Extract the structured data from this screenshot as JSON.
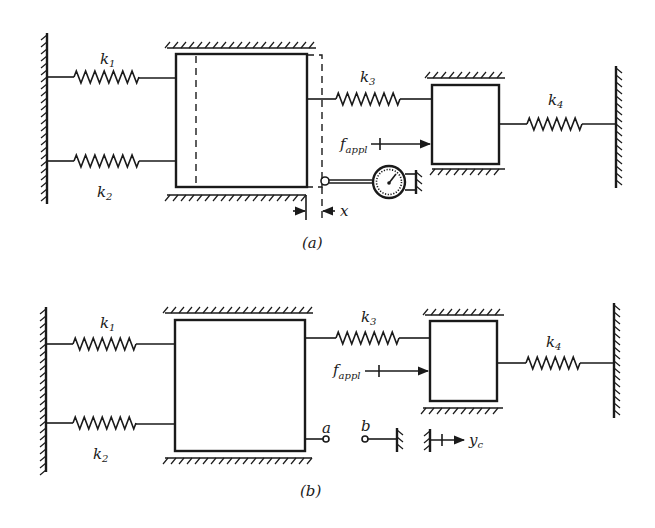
{
  "figure": {
    "panel_a": {
      "caption": "(a)",
      "springs": [
        {
          "name": "k1",
          "symbol": "k",
          "subscript": "1"
        },
        {
          "name": "k2",
          "symbol": "k",
          "subscript": "2"
        },
        {
          "name": "k3",
          "symbol": "k",
          "subscript": "3"
        },
        {
          "name": "k4",
          "symbol": "k",
          "subscript": "4"
        }
      ],
      "force_label": {
        "symbol": "f",
        "subscript": "appl"
      },
      "displacement_label": "x",
      "instrument": "dial-gauge"
    },
    "panel_b": {
      "caption": "(b)",
      "springs": [
        {
          "name": "k1",
          "symbol": "k",
          "subscript": "1"
        },
        {
          "name": "k2",
          "symbol": "k",
          "subscript": "2"
        },
        {
          "name": "k3",
          "symbol": "k",
          "subscript": "3"
        },
        {
          "name": "k4",
          "symbol": "k",
          "subscript": "4"
        }
      ],
      "force_label": {
        "symbol": "f",
        "subscript": "appl"
      },
      "terminal_a": "a",
      "terminal_b": "b",
      "displacement_label": {
        "symbol": "y",
        "subscript": "c"
      }
    }
  }
}
